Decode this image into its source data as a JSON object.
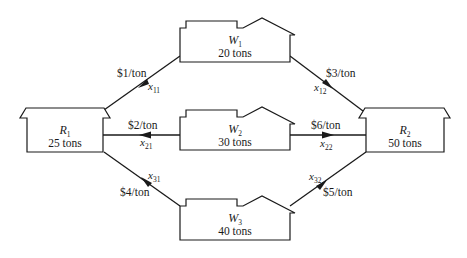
{
  "diagram": {
    "type": "transportation-network",
    "nodes": {
      "R1": {
        "name": "R",
        "sub": "1",
        "capacity": "25 tons"
      },
      "R2": {
        "name": "R",
        "sub": "2",
        "capacity": "50 tons"
      },
      "W1": {
        "name": "W",
        "sub": "1",
        "capacity": "20 tons"
      },
      "W2": {
        "name": "W",
        "sub": "2",
        "capacity": "30 tons"
      },
      "W3": {
        "name": "W",
        "sub": "3",
        "capacity": "40 tons"
      }
    },
    "edges": {
      "x11": {
        "var": "x",
        "sub": "11",
        "cost": "$1/ton",
        "from": "W1",
        "to": "R1"
      },
      "x12": {
        "var": "x",
        "sub": "12",
        "cost": "$3/ton",
        "from": "W1",
        "to": "R2"
      },
      "x21": {
        "var": "x",
        "sub": "21",
        "cost": "$2/ton",
        "from": "W2",
        "to": "R1"
      },
      "x22": {
        "var": "x",
        "sub": "22",
        "cost": "$6/ton",
        "from": "W2",
        "to": "R2"
      },
      "x31": {
        "var": "x",
        "sub": "31",
        "cost": "$4/ton",
        "from": "W3",
        "to": "R1"
      },
      "x32": {
        "var": "x",
        "sub": "32",
        "cost": "$5/ton",
        "from": "W3",
        "to": "R2"
      }
    },
    "colors": {
      "stroke": "#1a1a1a",
      "background": "#ffffff"
    }
  }
}
